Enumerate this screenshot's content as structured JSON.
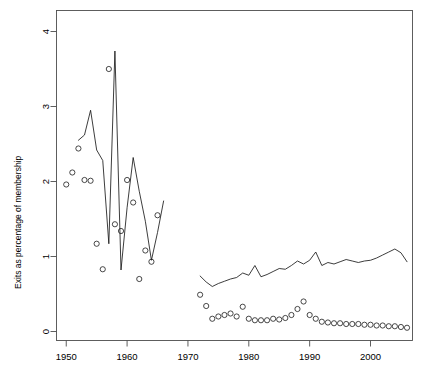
{
  "chart_data": {
    "type": "line",
    "title": "",
    "xlabel": "",
    "ylabel": "Exits as percentage of membership",
    "xlim": [
      1948.4,
      2006.9
    ],
    "ylim": [
      -0.12,
      4.28
    ],
    "xticks": [
      1950,
      1960,
      1970,
      1980,
      1990,
      2000
    ],
    "xtick_labels": [
      "1950",
      "1960",
      "1970",
      "1980",
      "1990",
      "2000"
    ],
    "yticks": [
      0,
      1,
      2,
      3,
      4
    ],
    "ytick_labels": [
      "0",
      "1",
      "2",
      "3",
      "4"
    ],
    "grid": false,
    "legend": null,
    "box": true,
    "series": [
      {
        "name": "early-line",
        "type": "line",
        "marker": "none",
        "x": [
          1952,
          1953,
          1954,
          1955,
          1956,
          1957,
          1958,
          1959,
          1960,
          1961,
          1962,
          1963,
          1964,
          1965,
          1966
        ],
        "y": [
          2.55,
          2.62,
          2.95,
          2.42,
          2.28,
          1.17,
          3.74,
          0.82,
          1.65,
          2.32,
          1.87,
          1.47,
          0.95,
          1.32,
          1.74
        ]
      },
      {
        "name": "early-points",
        "type": "scatter",
        "marker": "circle-open",
        "x": [
          1950,
          1951,
          1952,
          1953,
          1954,
          1955,
          1956,
          1957,
          1958,
          1959,
          1960,
          1961,
          1962,
          1963,
          1964,
          1965
        ],
        "y": [
          1.96,
          2.12,
          2.44,
          2.02,
          2.01,
          1.17,
          0.83,
          3.5,
          1.43,
          1.34,
          2.02,
          1.72,
          0.7,
          1.08,
          0.93,
          1.55
        ]
      },
      {
        "name": "late-line",
        "type": "line",
        "marker": "none",
        "x": [
          1972,
          1973,
          1974,
          1975,
          1976,
          1977,
          1978,
          1979,
          1980,
          1981,
          1982,
          1983,
          1984,
          1985,
          1986,
          1987,
          1988,
          1989,
          1990,
          1991,
          1992,
          1993,
          1994,
          1995,
          1996,
          1997,
          1998,
          1999,
          2000,
          2001,
          2002,
          2003,
          2004,
          2005,
          2006
        ],
        "y": [
          0.74,
          0.66,
          0.6,
          0.64,
          0.67,
          0.7,
          0.72,
          0.78,
          0.75,
          0.88,
          0.73,
          0.76,
          0.8,
          0.84,
          0.83,
          0.88,
          0.94,
          0.9,
          0.95,
          1.06,
          0.88,
          0.92,
          0.9,
          0.93,
          0.96,
          0.94,
          0.92,
          0.94,
          0.95,
          0.98,
          1.02,
          1.06,
          1.1,
          1.05,
          0.93
        ]
      },
      {
        "name": "late-points",
        "type": "scatter",
        "marker": "circle-open",
        "x": [
          1972,
          1973,
          1974,
          1975,
          1976,
          1977,
          1978,
          1979,
          1980,
          1981,
          1982,
          1983,
          1984,
          1985,
          1986,
          1987,
          1988,
          1989,
          1990,
          1991,
          1992,
          1993,
          1994,
          1995,
          1996,
          1997,
          1998,
          1999,
          2000,
          2001,
          2002,
          2003,
          2004,
          2005,
          2006
        ],
        "y": [
          0.49,
          0.34,
          0.17,
          0.2,
          0.22,
          0.24,
          0.2,
          0.33,
          0.17,
          0.15,
          0.15,
          0.15,
          0.17,
          0.16,
          0.18,
          0.22,
          0.3,
          0.4,
          0.22,
          0.17,
          0.13,
          0.12,
          0.11,
          0.11,
          0.1,
          0.1,
          0.1,
          0.09,
          0.09,
          0.08,
          0.08,
          0.07,
          0.07,
          0.06,
          0.05
        ]
      }
    ]
  },
  "colors": {
    "line": "#1a1a1a",
    "axis": "#4d4d4d",
    "text": "#000000",
    "background": "#ffffff"
  }
}
